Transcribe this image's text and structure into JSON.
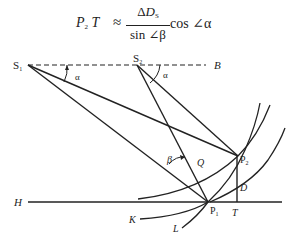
{
  "formula": {
    "lhs": "P",
    "lhs_sub": "2",
    "lhs_rest": " T",
    "approx": "≈",
    "numerator_delta": "Δ",
    "numerator_var": "D",
    "numerator_sub": "S",
    "denominator": "sin ∠β",
    "trailing": "cos ∠α"
  },
  "points": {
    "S1": {
      "label": "S",
      "sub": "1"
    },
    "S2": {
      "label": "S",
      "sub": "2"
    },
    "P1": {
      "label": "P",
      "sub": "1"
    },
    "P2": {
      "label": "P",
      "sub": "2"
    },
    "B": {
      "label": "B"
    },
    "H": {
      "label": "H"
    },
    "Q": {
      "label": "Q"
    },
    "D": {
      "label": "D"
    },
    "T": {
      "label": "T"
    },
    "K": {
      "label": "K"
    },
    "L": {
      "label": "L"
    }
  },
  "angles": {
    "alpha1": "α",
    "alpha2": "α",
    "beta": "β"
  },
  "colors": {
    "line": "#222222",
    "background": "#ffffff"
  }
}
